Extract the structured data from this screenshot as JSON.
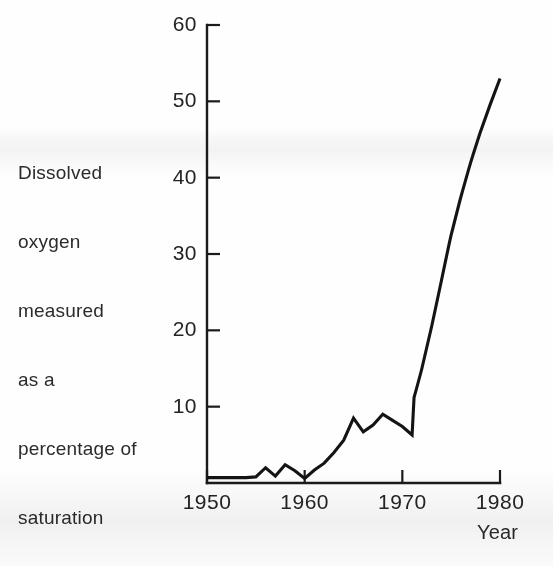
{
  "chart_data": {
    "type": "line",
    "title": "",
    "subtitle": "",
    "ylabel": "Dissolved oxygen measured as a percentage of saturation",
    "xlabel": "Year",
    "xlim": [
      1950,
      1980
    ],
    "ylim": [
      0,
      60
    ],
    "xticks": [
      1950,
      1960,
      1970,
      1980
    ],
    "xtick_labels": [
      "1950",
      "1960",
      "1970",
      "1980"
    ],
    "yticks": [
      10,
      20,
      30,
      40,
      50,
      60
    ],
    "ytick_labels": [
      "10",
      "20",
      "30",
      "40",
      "50",
      "60"
    ],
    "grid": false,
    "legend": "none",
    "line_color": "#141414",
    "line_width": 3,
    "series": [
      {
        "name": "Dissolved oxygen (% saturation)",
        "x": [
          1950,
          1951,
          1952,
          1953,
          1954,
          1955,
          1956,
          1957,
          1958,
          1959,
          1960,
          1961,
          1962,
          1963,
          1964,
          1965,
          1966,
          1967,
          1968,
          1969,
          1970,
          1971,
          1971.2,
          1972,
          1973,
          1974,
          1975,
          1976,
          1977,
          1978,
          1979,
          1980
        ],
        "values": [
          0.7,
          0.7,
          0.7,
          0.7,
          0.7,
          0.8,
          2.0,
          0.9,
          2.4,
          1.6,
          0.6,
          1.7,
          2.6,
          4.0,
          5.6,
          8.5,
          6.7,
          7.6,
          9.0,
          8.2,
          7.4,
          6.3,
          11.2,
          15.0,
          20.5,
          26.5,
          32.5,
          37.5,
          42.0,
          46.0,
          49.6,
          53.0
        ]
      }
    ],
    "annotations": []
  },
  "axis_titles": {
    "y_lines": [
      "Dissolved",
      "oxygen",
      "measured",
      "as a",
      "percentage of",
      "saturation"
    ],
    "x": "Year"
  },
  "colors": {
    "background": "#fefefe",
    "ink": "#141414",
    "text": "#242424"
  }
}
